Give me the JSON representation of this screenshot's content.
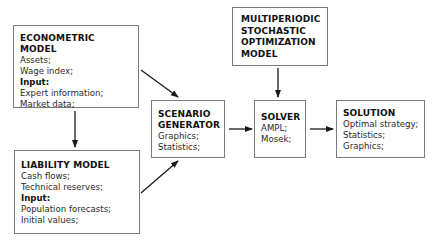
{
  "diagram": {
    "nodes": {
      "econometric": {
        "title": "ECONOMETRIC MODEL",
        "lines": [
          "Assets;",
          "Wage index;"
        ],
        "input_label": "Input:",
        "inputs": [
          "Expert information;",
          "Market data;"
        ]
      },
      "liability": {
        "title": "LIABILITY MODEL",
        "lines": [
          "Cash flows;",
          "Technical reserves;"
        ],
        "input_label": "Input:",
        "inputs": [
          "Population forecasts;",
          "Initial values;"
        ]
      },
      "scenario": {
        "title_lines": [
          "SCENARIO",
          "GENERATOR"
        ],
        "lines": [
          "Graphics;",
          "Statistics;"
        ]
      },
      "optimization": {
        "title_lines": [
          "MULTIPERIODIC",
          "STOCHASTIC",
          "OPTIMIZATION",
          "MODEL"
        ]
      },
      "solver": {
        "title": "SOLVER",
        "lines": [
          "AMPL;",
          "Mosek;"
        ]
      },
      "solution": {
        "title": "SOLUTION",
        "lines": [
          "Optimal strategy;",
          "Statistics;",
          "Graphics;"
        ]
      }
    },
    "edges": [
      {
        "from": "econometric",
        "to": "liability"
      },
      {
        "from": "econometric",
        "to": "scenario"
      },
      {
        "from": "liability",
        "to": "scenario"
      },
      {
        "from": "scenario",
        "to": "solver"
      },
      {
        "from": "optimization",
        "to": "solver"
      },
      {
        "from": "solver",
        "to": "solution"
      }
    ],
    "colors": {
      "border": "#7a7a7a",
      "arrow": "#1a1a1a",
      "text": "#1a1a1a"
    }
  }
}
